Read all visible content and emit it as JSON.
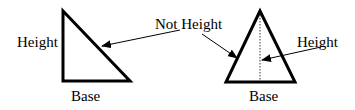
{
  "diagram": {
    "left_triangle": {
      "height_label": "Height",
      "base_label": "Base"
    },
    "center_label": "Not Height",
    "right_triangle": {
      "height_label": "Height",
      "base_label": "Base"
    },
    "colors": {
      "stroke": "#000000",
      "background": "#ffffff"
    }
  }
}
